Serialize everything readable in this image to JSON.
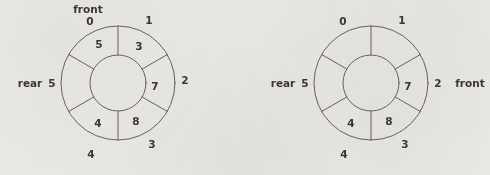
{
  "figure": {
    "background_color": "#edebe7",
    "ink_color": "#5e5a55",
    "text_color": "#3a3733",
    "slot_count": 6
  },
  "diagrams": [
    {
      "id": "left",
      "name": "circular-queue-before",
      "center": {
        "x": 118,
        "y": 83
      },
      "outer_radius": 57,
      "inner_radius": 28,
      "front_label": "front",
      "front_label_position": "top",
      "rear_label": "rear",
      "rear_index_label": "5",
      "slots": [
        {
          "index": "0",
          "value": "5"
        },
        {
          "index": "1",
          "value": "3"
        },
        {
          "index": "2",
          "value": "7"
        },
        {
          "index": "3",
          "value": "8"
        },
        {
          "index": "4",
          "value": "4"
        },
        {
          "index": "5",
          "value": ""
        }
      ]
    },
    {
      "id": "right",
      "name": "circular-queue-after",
      "center": {
        "x": 371,
        "y": 83
      },
      "outer_radius": 57,
      "inner_radius": 28,
      "front_label": "front",
      "front_label_position": "right",
      "front_index_label": "2",
      "rear_label": "rear",
      "rear_index_label": "5",
      "slots": [
        {
          "index": "0",
          "value": ""
        },
        {
          "index": "1",
          "value": ""
        },
        {
          "index": "2",
          "value": "7"
        },
        {
          "index": "3",
          "value": "8"
        },
        {
          "index": "4",
          "value": "4"
        },
        {
          "index": "5",
          "value": ""
        }
      ]
    }
  ]
}
